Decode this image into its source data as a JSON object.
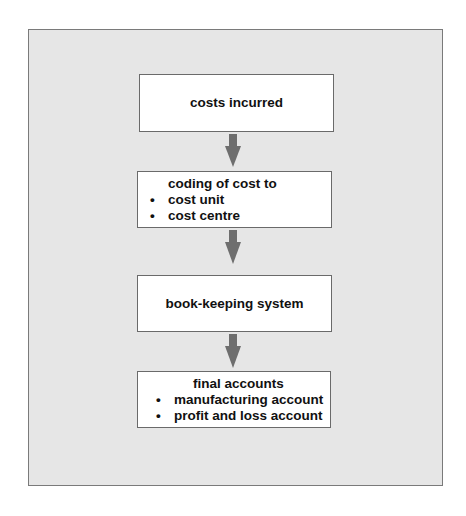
{
  "diagram": {
    "type": "flowchart",
    "direction": "top-to-bottom",
    "colors": {
      "panel_bg": "#e6e6e6",
      "box_bg": "#ffffff",
      "border": "#6a6a6a",
      "arrow": "#6e6e6e",
      "text": "#111111"
    },
    "nodes": [
      {
        "id": "n1",
        "title": "costs incurred",
        "bullets": []
      },
      {
        "id": "n2",
        "title": "coding of cost to",
        "bullets": [
          "cost unit",
          "cost centre"
        ]
      },
      {
        "id": "n3",
        "title": "book-keeping system",
        "bullets": []
      },
      {
        "id": "n4",
        "title": "final accounts",
        "bullets": [
          "manufacturing account",
          "profit and loss account"
        ]
      }
    ],
    "edges": [
      {
        "from": "n1",
        "to": "n2"
      },
      {
        "from": "n2",
        "to": "n3"
      },
      {
        "from": "n3",
        "to": "n4"
      }
    ],
    "bullet_glyph": "•"
  }
}
